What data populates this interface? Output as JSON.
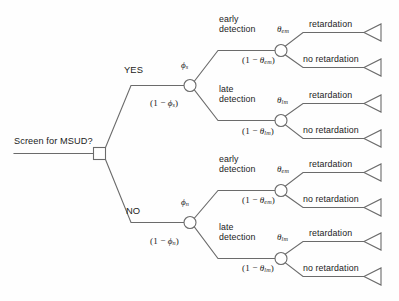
{
  "figure": {
    "type": "decision-tree",
    "root_label": "Screen for MSUD?",
    "root_node_type": "decision-square",
    "branch_yes_label": "YES",
    "branch_no_label": "NO"
  },
  "probabilities": {
    "phi_s": "ϕ",
    "phi_s_sub": "s",
    "one_minus_phi_s_pre": "(1 − ",
    "one_minus_phi_s_post": ")",
    "phi_n": "ϕ",
    "phi_n_sub": "n",
    "theta_em": "θ",
    "theta_em_sub": "em",
    "theta_lm": "θ",
    "theta_lm_sub": "lm"
  },
  "detection": {
    "early": "early\ndetection",
    "late": "late\ndetection"
  },
  "outcomes": {
    "retardation": "retardation",
    "no_retardation": "no retardation"
  },
  "nodes": {
    "decision": {
      "x": 99,
      "y": 153
    },
    "chance_yes": {
      "x": 190,
      "y": 85
    },
    "chance_no": {
      "x": 190,
      "y": 222
    },
    "chance_yes_early": {
      "x": 281,
      "y": 50
    },
    "chance_yes_late": {
      "x": 281,
      "y": 120
    },
    "chance_no_early": {
      "x": 281,
      "y": 190
    },
    "chance_no_late": {
      "x": 281,
      "y": 258
    }
  },
  "terminals": [
    {
      "label": "retardation",
      "y": 32
    },
    {
      "label": "no retardation",
      "y": 67
    },
    {
      "label": "retardation",
      "y": 103
    },
    {
      "label": "no retardation",
      "y": 138
    },
    {
      "label": "retardation",
      "y": 172
    },
    {
      "label": "no retardation",
      "y": 207
    },
    {
      "label": "retardation",
      "y": 241
    },
    {
      "label": "no retardation",
      "y": 276
    }
  ],
  "colors": {
    "stroke": "#6b6b6b",
    "text": "#1b1b1b",
    "background": "#ffffff"
  }
}
